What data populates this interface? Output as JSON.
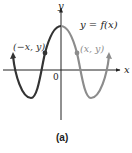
{
  "figure": {
    "caption": "(a)",
    "function_label": "y = f(x)",
    "axis_labels": {
      "x": "x",
      "y": "y"
    },
    "origin_label": "0",
    "points": [
      {
        "label": "(−x, y)",
        "side": "left"
      },
      {
        "label": "(x, y)",
        "side": "right"
      }
    ],
    "colors": {
      "left_curve": "#333333",
      "right_curve": "#8c8c8c",
      "axes": "#222222"
    }
  }
}
